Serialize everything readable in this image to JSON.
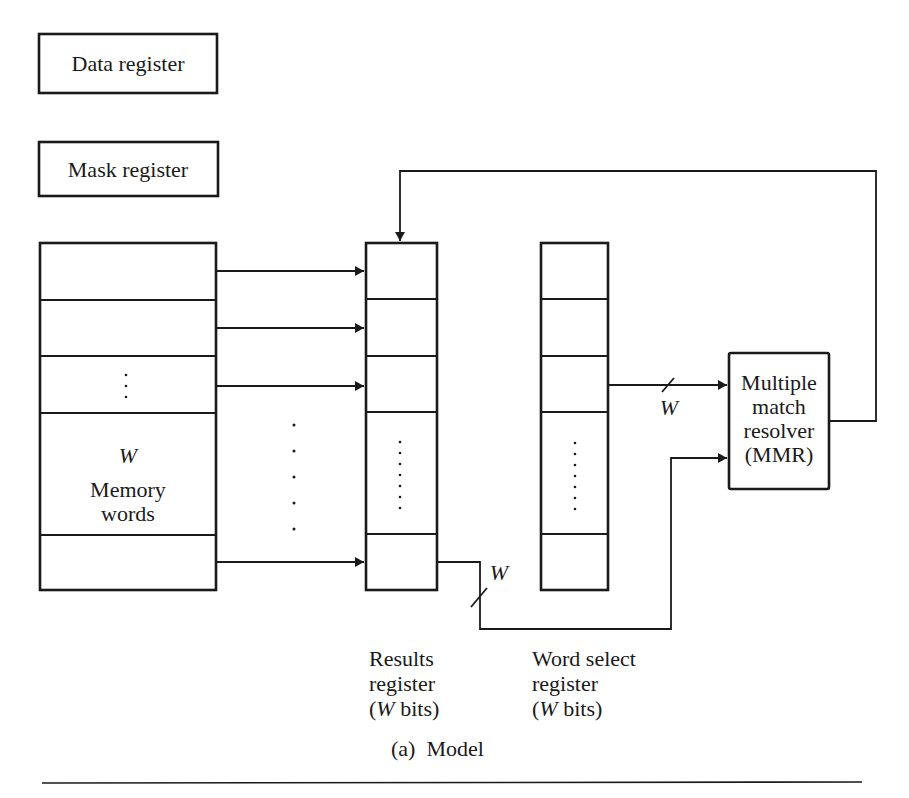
{
  "diagram": {
    "data_register": {
      "label": "Data register"
    },
    "mask_register": {
      "label": "Mask register"
    },
    "memory": {
      "width_symbol": "W",
      "label_line1": "Memory",
      "label_line2": "words",
      "ellipsis": "⋮"
    },
    "results_register": {
      "caption_line1": "Results",
      "caption_line2": "register",
      "caption_line3_open": "(",
      "caption_line3_symbol": "W",
      "caption_line3_rest": " bits)"
    },
    "word_select_register": {
      "caption_line1": "Word select",
      "caption_line2": "register",
      "caption_line3_open": "(",
      "caption_line3_symbol": "W",
      "caption_line3_rest": " bits)"
    },
    "mmr": {
      "line1": "Multiple",
      "line2": "match",
      "line3": "resolver",
      "line4": "(MMR)"
    },
    "bus_labels": {
      "word_select_to_mmr": "W",
      "results_to_mmr": "W"
    },
    "caption": "(a)  Model"
  },
  "colors": {
    "ink": "#1a1a1a",
    "paper": "#ffffff"
  }
}
